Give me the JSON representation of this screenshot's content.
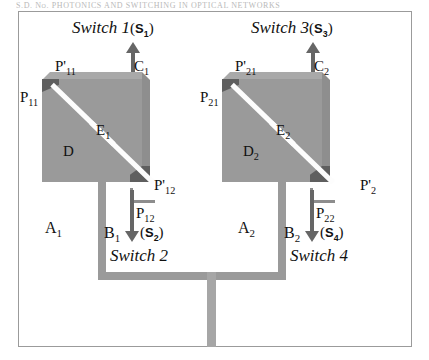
{
  "header_line": "S.D. No. PHOTONICS AND SWITCHING IN OPTICAL NETWORKS",
  "figure": {
    "switches": [
      {
        "title": "Switch 1",
        "badge_open": "(",
        "badge": "S",
        "badge_sub": "1",
        "badge_close": ")",
        "block_labels": {
          "top_left_port": "P'",
          "top_left_port_sub": "11",
          "left_port": "P",
          "left_port_sub": "11",
          "top_right_port": "C",
          "top_right_port_sub": "1",
          "bottom_right_port": "P'",
          "bottom_right_port_sub": "12",
          "inner_left": "D",
          "inner_left_sub": "",
          "inner_right": "E",
          "inner_right_sub": "1"
        }
      },
      {
        "title": "Switch 3",
        "badge_open": "(",
        "badge": "S",
        "badge_sub": "3",
        "badge_close": ")",
        "block_labels": {
          "top_left_port": "P'",
          "top_left_port_sub": "21",
          "left_port": "P",
          "left_port_sub": "21",
          "top_right_port": "C",
          "top_right_port_sub": "2",
          "bottom_right_port": "P'",
          "bottom_right_port_sub": "2",
          "inner_left": "D",
          "inner_left_sub": "2",
          "inner_right": "E",
          "inner_right_sub": "2"
        }
      }
    ],
    "lower_switches": [
      {
        "title": "Switch 2",
        "badge_open": "(",
        "badge": "S",
        "badge_sub": "2",
        "badge_close": ")",
        "branch": "B",
        "branch_sub": "1",
        "port": "P",
        "port_sub": "12",
        "zone": "A",
        "zone_sub": "1"
      },
      {
        "title": "Switch 4",
        "badge_open": "(",
        "badge": "S",
        "badge_sub": "4",
        "badge_close": ")",
        "branch": "B",
        "branch_sub": "2",
        "port": "P",
        "port_sub": "22",
        "zone": "A",
        "zone_sub": "2"
      }
    ]
  },
  "colors": {
    "block_fill": "#9a9a9a",
    "bevel_light": "#a9a9a9",
    "bevel_dark": "#8e8e8e",
    "corner_marker": "#5f5f5f",
    "waveguide": "#fdfdfd",
    "arrow": "#666666",
    "pipe": "#9a9a9a",
    "frame_border": "#9b9b9b",
    "text": "#111111"
  }
}
